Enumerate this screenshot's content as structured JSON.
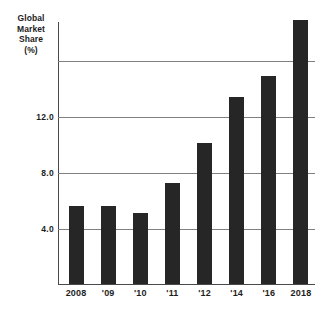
{
  "chart_data": {
    "type": "bar",
    "title": "",
    "xlabel": "",
    "ylabel": "Global Market Share (%)",
    "ylabel_lines": [
      "Global",
      "Market",
      "Share",
      "(%)"
    ],
    "categories": [
      "2008",
      "'09",
      "'10",
      "'11",
      "'12",
      "'14",
      "'16",
      "2018"
    ],
    "values": [
      5.6,
      5.6,
      5.1,
      7.2,
      10.1,
      13.4,
      14.9,
      18.9
    ],
    "ylim": [
      0,
      18.8
    ],
    "yticks": [
      4.0,
      8.0,
      12.0
    ],
    "ytick_labels": [
      "4.0",
      "8.0",
      "12.0"
    ],
    "gridlines": [
      4.0,
      8.0,
      12.0,
      16.0
    ],
    "grid": true,
    "legend": null,
    "bar_color": "#262626",
    "grid_color": "#808080",
    "axis_color": "#4a4a4a"
  }
}
